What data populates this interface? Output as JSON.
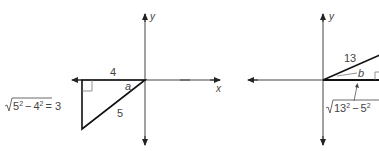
{
  "left_figure": {
    "y_axis_label": "y",
    "x_axis_label": "x",
    "horizontal_leg": "4",
    "hypotenuse": "5",
    "angle_label": "a",
    "vertical_leg_expr": {
      "radicand_base1": "5",
      "exp1": "2",
      "minus": "−",
      "radicand_base2": "4",
      "exp2": "2",
      "result": "= 3"
    }
  },
  "right_figure": {
    "y_axis_label": "y",
    "hypotenuse": "13",
    "angle_label": "b",
    "horizontal_leg_expr": {
      "radicand_base1": "13",
      "exp1": "2",
      "minus": "−",
      "radicand_base2": "5",
      "exp2": "2"
    }
  },
  "colors": {
    "axis": "#333333",
    "triangle": "#111111",
    "text": "#444444"
  }
}
